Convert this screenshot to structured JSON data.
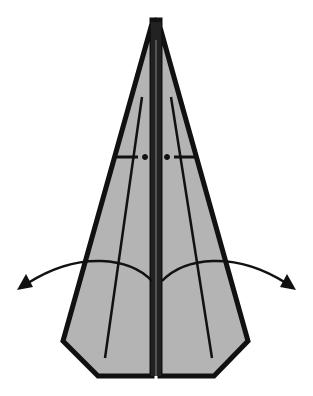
{
  "diagram": {
    "type": "origami-fold-instruction",
    "colors": {
      "paper_fill": "#b4b4b4",
      "outline": "#111111",
      "background": "#ffffff"
    },
    "elements": [
      {
        "name": "left-wing",
        "description": "left half of folded paper, gray with thick black outline"
      },
      {
        "name": "right-wing",
        "description": "right half of folded paper, gray with thick black outline"
      },
      {
        "name": "center-fold",
        "description": "central vertical fold/keel"
      },
      {
        "name": "crease-lines",
        "description": "thin diagonal crease lines on each wing"
      },
      {
        "name": "dash-dot-fold-marks",
        "description": "horizontal mountain-fold dash-dot marks near top"
      },
      {
        "name": "unfold-arrows",
        "description": "two curved arrows pointing outward, indicating opening the wings"
      }
    ]
  }
}
